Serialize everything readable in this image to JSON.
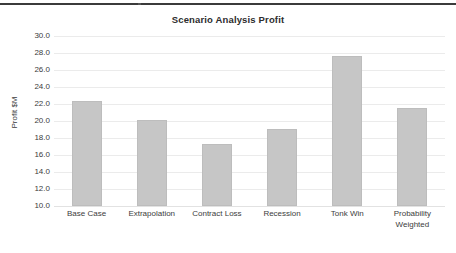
{
  "top_rule": {
    "present": true,
    "color": "#3b3b3b"
  },
  "chart_data": {
    "type": "bar",
    "title": "Scenario Analysis Profit",
    "xlabel": "",
    "ylabel": "Profit $M",
    "categories": [
      "Base Case",
      "Extrapolation",
      "Contract Loss",
      "Recession",
      "Tonk Win",
      "Probability Weighted"
    ],
    "category_lines": [
      [
        "Base Case"
      ],
      [
        "Extrapolation"
      ],
      [
        "Contract Loss"
      ],
      [
        "Recession"
      ],
      [
        "Tonk Win"
      ],
      [
        "Probability",
        "Weighted"
      ]
    ],
    "values": [
      22.4,
      20.1,
      17.3,
      19.1,
      27.7,
      21.5
    ],
    "ylim": [
      10.0,
      30.0
    ],
    "ytick_step": 2.0,
    "yticks": [
      30.0,
      28.0,
      26.0,
      24.0,
      22.0,
      20.0,
      18.0,
      16.0,
      14.0,
      12.0,
      10.0
    ],
    "ytick_labels": [
      "30.0",
      "28.0",
      "26.0",
      "24.0",
      "22.0",
      "20.0",
      "18.0",
      "16.0",
      "14.0",
      "12.0",
      "10.0"
    ],
    "grid": true,
    "legend": false,
    "legend_position": "none",
    "bar_color": "#c6c6c6",
    "bar_edge_color": "#bdbdbd",
    "grid_color": "#ebebeb",
    "background_color": "#ffffff",
    "title_color": "#2d2d2d",
    "text_color": "#3c3c3c"
  }
}
